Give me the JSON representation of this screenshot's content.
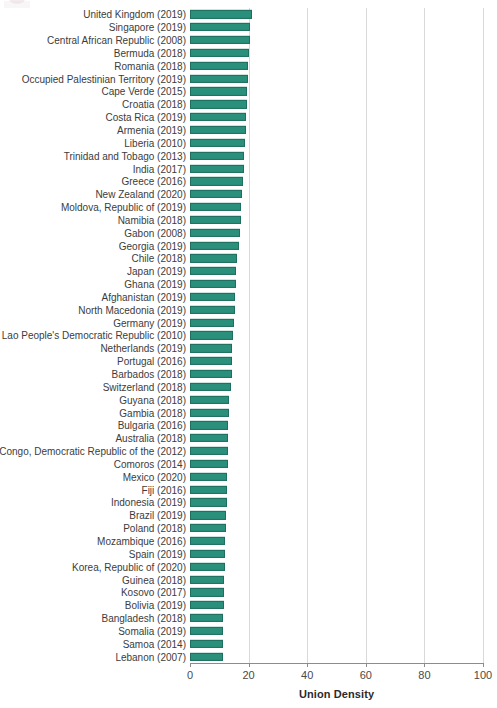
{
  "chart_data": {
    "type": "bar",
    "orientation": "horizontal",
    "title": "",
    "xlabel": "Union Density",
    "ylabel": "",
    "xlim": [
      0,
      100
    ],
    "xticks": [
      0,
      20,
      40,
      60,
      80,
      100
    ],
    "xtick_labels": [
      "0",
      "20",
      "40",
      "60",
      "80",
      "100"
    ],
    "grid": "vertical",
    "legend": "none",
    "bar_color": "#2a8f7b",
    "bar_edge_color": "#1f6f5f",
    "categories": [
      "United Kingdom (2019)",
      "Singapore (2019)",
      "Central African Republic (2008)",
      "Bermuda (2018)",
      "Romania (2018)",
      "Occupied Palestinian Territory (2019)",
      "Cape Verde (2015)",
      "Croatia (2018)",
      "Costa Rica (2019)",
      "Armenia (2019)",
      "Liberia (2010)",
      "Trinidad and Tobago (2013)",
      "India (2017)",
      "Greece (2016)",
      "New Zealand (2020)",
      "Moldova, Republic of (2019)",
      "Namibia (2018)",
      "Gabon (2008)",
      "Georgia (2019)",
      "Chile (2018)",
      "Japan (2019)",
      "Ghana (2019)",
      "Afghanistan (2019)",
      "North Macedonia (2019)",
      "Germany (2019)",
      "Lao People's Democratic Republic (2010)",
      "Netherlands (2019)",
      "Portugal (2016)",
      "Barbados (2018)",
      "Switzerland (2018)",
      "Guyana (2018)",
      "Gambia (2018)",
      "Bulgaria (2016)",
      "Australia (2018)",
      "Congo, Democratic Republic of the (2012)",
      "Comoros (2014)",
      "Mexico (2020)",
      "Fiji (2016)",
      "Indonesia (2019)",
      "Brazil (2019)",
      "Poland (2018)",
      "Mozambique (2016)",
      "Spain (2019)",
      "Korea, Republic of (2020)",
      "Guinea (2018)",
      "Kosovo (2017)",
      "Bolivia (2019)",
      "Bangladesh (2018)",
      "Somalia (2019)",
      "Samoa (2014)",
      "Lebanon (2007)"
    ],
    "values": [
      21.2,
      20.6,
      20.4,
      20.2,
      19.9,
      19.7,
      19.5,
      19.3,
      19.2,
      19.1,
      18.7,
      18.5,
      18.3,
      18.1,
      17.9,
      17.5,
      17.3,
      17.1,
      16.8,
      15.9,
      15.7,
      15.6,
      15.4,
      15.3,
      15.1,
      14.6,
      14.5,
      14.4,
      14.2,
      13.9,
      13.3,
      13.2,
      13.1,
      13.0,
      12.9,
      12.8,
      12.7,
      12.6,
      12.5,
      12.4,
      12.3,
      12.0,
      11.9,
      11.8,
      11.7,
      11.6,
      11.5,
      11.4,
      11.3,
      11.2,
      11.1
    ]
  }
}
